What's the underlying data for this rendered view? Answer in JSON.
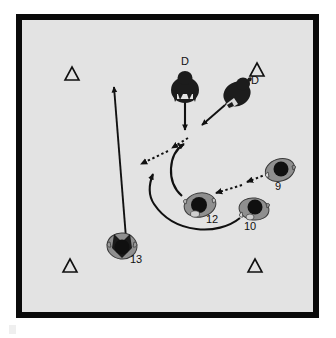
{
  "diagram": {
    "court": {
      "frame_color": "#0a0a0a",
      "surface_color": "#e3e3e3",
      "width": 291,
      "height": 292
    },
    "cones": [
      {
        "id": "cone-top-left",
        "label": "△",
        "x": 50,
        "y": 54
      },
      {
        "id": "cone-top-right",
        "label": "△",
        "x": 235,
        "y": 50
      },
      {
        "id": "cone-bottom-left",
        "label": "△",
        "x": 48,
        "y": 246
      },
      {
        "id": "cone-bottom-right",
        "label": "△",
        "x": 233,
        "y": 246
      }
    ],
    "defenders": [
      {
        "id": "defender-center",
        "label": "D",
        "x": 163,
        "y": 64,
        "label_x": 160,
        "label_y": 44
      },
      {
        "id": "defender-right",
        "label": "D",
        "x": 213,
        "y": 70,
        "label_x": 228,
        "label_y": 60
      }
    ],
    "players": [
      {
        "id": "player-9",
        "number": "9",
        "x": 258,
        "y": 150,
        "label_x": 255,
        "label_y": 168
      },
      {
        "id": "player-10",
        "number": "10",
        "x": 232,
        "y": 189,
        "label_x": 226,
        "label_y": 207
      },
      {
        "id": "player-12",
        "number": "12",
        "x": 178,
        "y": 185,
        "label_x": 188,
        "label_y": 200
      },
      {
        "id": "player-13",
        "number": "13",
        "x": 100,
        "y": 226,
        "label_x": 111,
        "label_y": 240
      }
    ],
    "movement_arrows": [
      {
        "id": "arrow-player-13-up",
        "style": "solid-straight",
        "from": "player-13",
        "to": "cone-top-left-area"
      },
      {
        "id": "arrow-defender-center-down",
        "style": "solid-straight",
        "from": "defender-center",
        "to": "key-area"
      },
      {
        "id": "arrow-defender-right",
        "style": "solid-double",
        "from": "defender-right",
        "to": "key-area"
      },
      {
        "id": "arrow-player-12-curve-up",
        "style": "solid-curved",
        "from": "player-12",
        "to": "top-key"
      },
      {
        "id": "arrow-player-10-curve-left",
        "style": "solid-curved",
        "from": "player-10",
        "to": "left-wing"
      }
    ],
    "pass_arrows": [
      {
        "id": "pass-to-left-wing",
        "style": "dotted",
        "from": "top-key",
        "to": "left-wing"
      },
      {
        "id": "pass-9-to-12",
        "style": "dotted",
        "from": "player-9",
        "to": "player-12"
      }
    ],
    "colors": {
      "ink": "#111111",
      "defender_fill": "#1a1a1a",
      "player_jersey": "#8f8f8f",
      "player_head": "#101010",
      "cone_outline": "#101010"
    }
  }
}
